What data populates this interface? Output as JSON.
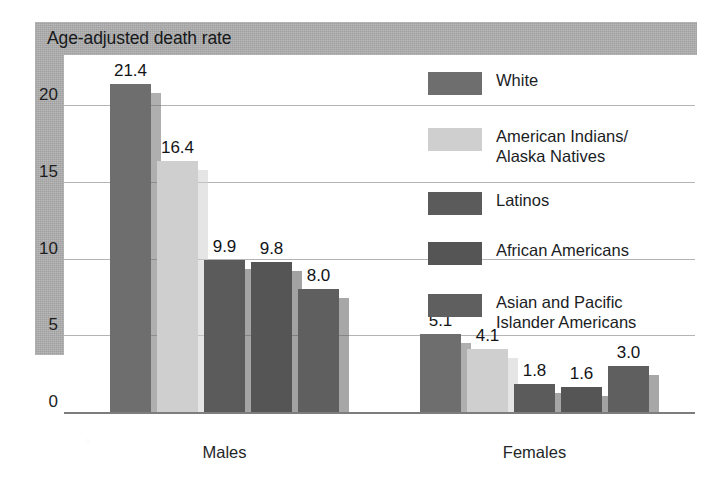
{
  "header": {
    "title": "Age-adjusted death rate",
    "band_color": "#a9a9a9"
  },
  "axis": {
    "y_ticks": [
      "0",
      "5",
      "10",
      "15",
      "20"
    ],
    "y_min": 0,
    "y_max": 22.5,
    "gridline_color": "#b4b4b4"
  },
  "groups": [
    {
      "label": "Males"
    },
    {
      "label": "Females"
    }
  ],
  "legend": [
    {
      "label": "White",
      "color": "#6e6e6e"
    },
    {
      "label": "American Indians/\nAlaska Natives",
      "color": "#cfcfcf"
    },
    {
      "label": "Latinos",
      "color": "#5b5b5b"
    },
    {
      "label": "African Americans",
      "color": "#555555"
    },
    {
      "label": "Asian and Pacific\nIslander Americans",
      "color": "#5f5f5f"
    }
  ],
  "bar_value_labels": {
    "males": [
      "21.4",
      "16.4",
      "9.9",
      "9.8",
      "8.0"
    ],
    "females": [
      "5.1",
      "4.1",
      "1.8",
      "1.6",
      "3.0"
    ]
  },
  "chart_data": {
    "type": "bar",
    "title": "Age-adjusted death rate",
    "xlabel": "",
    "ylabel": "",
    "ylim": [
      0,
      22.5
    ],
    "yticks": [
      0,
      5,
      10,
      15,
      20
    ],
    "grid": true,
    "legend_position": "inside-upper-right",
    "categories": [
      "Males",
      "Females"
    ],
    "series": [
      {
        "name": "White",
        "color": "#6e6e6e",
        "values": [
          21.4,
          5.1
        ]
      },
      {
        "name": "American Indians/Alaska Natives",
        "color": "#cfcfcf",
        "values": [
          16.4,
          4.1
        ]
      },
      {
        "name": "Latinos",
        "color": "#5b5b5b",
        "values": [
          9.9,
          1.8
        ]
      },
      {
        "name": "African Americans",
        "color": "#555555",
        "values": [
          9.8,
          1.6
        ]
      },
      {
        "name": "Asian and Pacific Islander Americans",
        "color": "#5f5f5f",
        "values": [
          8.0,
          3.0
        ]
      }
    ],
    "data_labels": [
      [
        "21.4",
        "16.4",
        "9.9",
        "9.8",
        "8.0"
      ],
      [
        "5.1",
        "4.1",
        "1.8",
        "1.6",
        "3.0"
      ]
    ]
  }
}
